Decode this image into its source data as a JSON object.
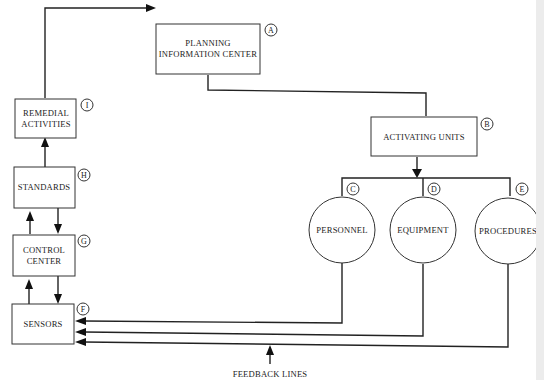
{
  "diagram": {
    "nodes": [
      {
        "id": "A",
        "shape": "rect",
        "lines": [
          "PLANNING",
          "INFORMATION CENTER"
        ]
      },
      {
        "id": "B",
        "shape": "rect",
        "lines": [
          "ACTIVATING UNITS"
        ]
      },
      {
        "id": "C",
        "shape": "circle",
        "lines": [
          "PERSONNEL"
        ]
      },
      {
        "id": "D",
        "shape": "circle",
        "lines": [
          "EQUIPMENT"
        ]
      },
      {
        "id": "E",
        "shape": "circle",
        "lines": [
          "PROCEDURES"
        ]
      },
      {
        "id": "F",
        "shape": "rect",
        "lines": [
          "SENSORS"
        ]
      },
      {
        "id": "G",
        "shape": "rect",
        "lines": [
          "CONTROL",
          "CENTER"
        ]
      },
      {
        "id": "H",
        "shape": "rect",
        "lines": [
          "STANDARDS"
        ]
      },
      {
        "id": "I",
        "shape": "rect",
        "lines": [
          "REMEDIAL",
          "ACTIVITIES"
        ]
      }
    ],
    "edges": [
      {
        "from": "I",
        "to": "A"
      },
      {
        "from": "A",
        "to": "B"
      },
      {
        "from": "B",
        "to": [
          "C",
          "D",
          "E"
        ]
      },
      {
        "from": "C",
        "to": "F",
        "label": "feedback"
      },
      {
        "from": "D",
        "to": "F",
        "label": "feedback"
      },
      {
        "from": "E",
        "to": "F",
        "label": "feedback"
      },
      {
        "from": "F",
        "to": "G"
      },
      {
        "from": "G",
        "to": "F"
      },
      {
        "from": "G",
        "to": "H"
      },
      {
        "from": "H",
        "to": "G"
      },
      {
        "from": "H",
        "to": "I"
      }
    ],
    "annotation": "FEEDBACK LINES"
  }
}
